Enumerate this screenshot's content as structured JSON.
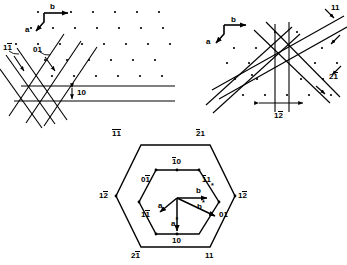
{
  "figure": {
    "type": "crystallographic-diffraction-diagram",
    "panels": [
      "reciprocal-lattice-rows",
      "reciprocal-lattice-crossed",
      "hexagon-zone"
    ]
  },
  "panel_left": {
    "name": "reciprocal lattice with row traces",
    "axes": {
      "a": "a",
      "b": "b"
    },
    "labels": {
      "line_11bar": {
        "digits": "1",
        "overbar": "1"
      },
      "line_01": "01",
      "spacing_10": "10"
    },
    "lattice": {
      "rows": 5,
      "cols": 8
    }
  },
  "panel_right": {
    "name": "reciprocal lattice with crossed bands",
    "axes": {
      "a": "a",
      "b": "b"
    },
    "labels": {
      "band_11": "11",
      "band_21bar": {
        "digits": "2",
        "overbar": "1"
      },
      "band_12bar": {
        "digits": "1",
        "overbar": "2"
      }
    }
  },
  "panel_hexagon": {
    "name": "hexagonal zone with direct and reciprocal vectors",
    "outer_labels": [
      {
        "id": "outer-top-left",
        "pre": "",
        "bar1": "1",
        "bar2": "1"
      },
      {
        "id": "outer-top-right",
        "pre": "",
        "bar1": "2",
        "post": "1"
      },
      {
        "id": "outer-left",
        "pre": "1",
        "bar1": "2"
      },
      {
        "id": "outer-right",
        "pre": "1",
        "bar1": "2"
      },
      {
        "id": "outer-bottom-left",
        "pre": "2",
        "bar1": "1"
      },
      {
        "id": "outer-bottom-right",
        "plain": "11"
      }
    ],
    "inner_labels": [
      {
        "id": "inner-top",
        "bar1": "1",
        "post": "0"
      },
      {
        "id": "inner-upper-left",
        "pre": "0",
        "bar1": "1"
      },
      {
        "id": "inner-upper-right",
        "bar1": "1",
        "post": "1"
      },
      {
        "id": "inner-lower-left",
        "pre": "1",
        "bar1": "1"
      },
      {
        "id": "inner-lower-right",
        "plain": "01"
      },
      {
        "id": "inner-bottom",
        "plain": "10"
      }
    ],
    "vectors": {
      "a": "a",
      "b": "b",
      "a_star": "a",
      "b_star": "b",
      "star_mark": "*"
    }
  }
}
